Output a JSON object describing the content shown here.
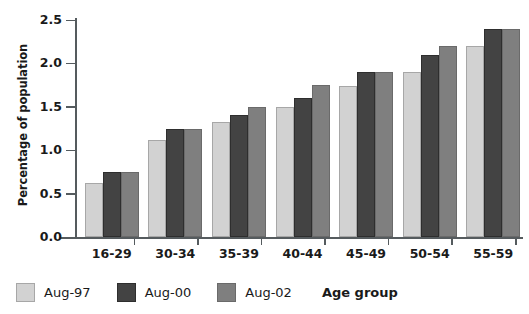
{
  "chart_data": {
    "type": "bar",
    "title": "",
    "xlabel": "Age group",
    "ylabel": "Percentage of population",
    "categories": [
      "16-29",
      "30-34",
      "35-39",
      "40-44",
      "45-49",
      "50-54",
      "55-59"
    ],
    "series": [
      {
        "name": "Aug-97",
        "color": "#d2d2d2",
        "values": [
          0.62,
          1.12,
          1.32,
          1.5,
          1.74,
          1.9,
          2.2
        ]
      },
      {
        "name": "Aug-00",
        "color": "#434343",
        "values": [
          0.75,
          1.25,
          1.4,
          1.6,
          1.9,
          2.1,
          2.4
        ]
      },
      {
        "name": "Aug-02",
        "color": "#7f7f7f",
        "values": [
          0.75,
          1.25,
          1.5,
          1.75,
          1.9,
          2.2,
          2.4
        ]
      }
    ],
    "ylim": [
      0.0,
      2.5
    ],
    "ytick_labels": [
      "0.0",
      "0.5",
      "1.0",
      "1.5",
      "2.0",
      "2.5"
    ],
    "ytick_values": [
      0.0,
      0.5,
      1.0,
      1.5,
      2.0,
      2.5
    ],
    "grid": false,
    "legend_position": "bottom-left"
  }
}
